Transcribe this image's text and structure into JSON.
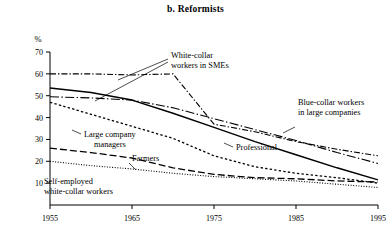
{
  "chart_data": {
    "type": "line",
    "title": "b. Reformists",
    "xlabel": "",
    "ylabel": "%",
    "xlim": [
      1955,
      1995
    ],
    "ylim": [
      0,
      70
    ],
    "ytick_values": [
      10,
      20,
      30,
      40,
      50,
      60,
      70
    ],
    "ytick_labels": [
      "10",
      "20",
      "30",
      "40",
      "50",
      "60",
      "70"
    ],
    "xtick_values": [
      1955,
      1965,
      1975,
      1985,
      1995
    ],
    "xtick_labels": [
      "1955",
      "1965",
      "1975",
      "1985",
      "1995"
    ],
    "grid": false,
    "legend_position": "inline-annotations",
    "x": [
      1955,
      1960,
      1965,
      1970,
      1975,
      1980,
      1985,
      1990,
      1995
    ],
    "series": [
      {
        "name": "White-collar workers in SMEs",
        "style": "dash-dot",
        "values": [
          60,
          60,
          59.5,
          60,
          37,
          33.5,
          29,
          25.5,
          22.5
        ]
      },
      {
        "name": "Blue-collar workers in large companies",
        "style": "dash-dot-long",
        "values": [
          49.5,
          49,
          48,
          44.5,
          39.5,
          34.5,
          29.5,
          24,
          19
        ]
      },
      {
        "name": "Professional",
        "style": "solid",
        "values": [
          53.5,
          51.5,
          48,
          42,
          35.5,
          29,
          23,
          17,
          11.5
        ]
      },
      {
        "name": "Large company managers",
        "style": "dotted-coarse",
        "values": [
          47,
          41.5,
          36,
          30.5,
          22.5,
          17.5,
          14.5,
          12.5,
          10
        ]
      },
      {
        "name": "Farmers",
        "style": "dashed",
        "values": [
          26,
          24,
          21.5,
          17,
          14,
          12.5,
          12,
          11,
          10.5
        ]
      },
      {
        "name": "Self-employed white-collar workers",
        "style": "dotted-fine",
        "values": [
          20,
          18,
          16.5,
          14.5,
          13,
          12,
          11,
          9.5,
          8
        ]
      }
    ],
    "annotations": [
      {
        "text_line1": "White-collar",
        "text_line2": "workers in SMEs",
        "target": "White-collar workers in SMEs"
      },
      {
        "text_line1": "Blue-collar workers",
        "text_line2": "in large companies",
        "target": "Blue-collar workers in large companies"
      },
      {
        "text_line1": "Professional",
        "text_line2": "",
        "target": "Professional"
      },
      {
        "text_line1": "Large company",
        "text_line2": "managers",
        "target": "Large company managers"
      },
      {
        "text_line1": "Farmers",
        "text_line2": "",
        "target": "Farmers"
      },
      {
        "text_line1": "Self-employed",
        "text_line2": "white-collar workers",
        "target": "Self-employed white-collar workers"
      }
    ],
    "colors": {
      "line": "#000000",
      "axis": "#000000",
      "background": "#ffffff"
    }
  }
}
